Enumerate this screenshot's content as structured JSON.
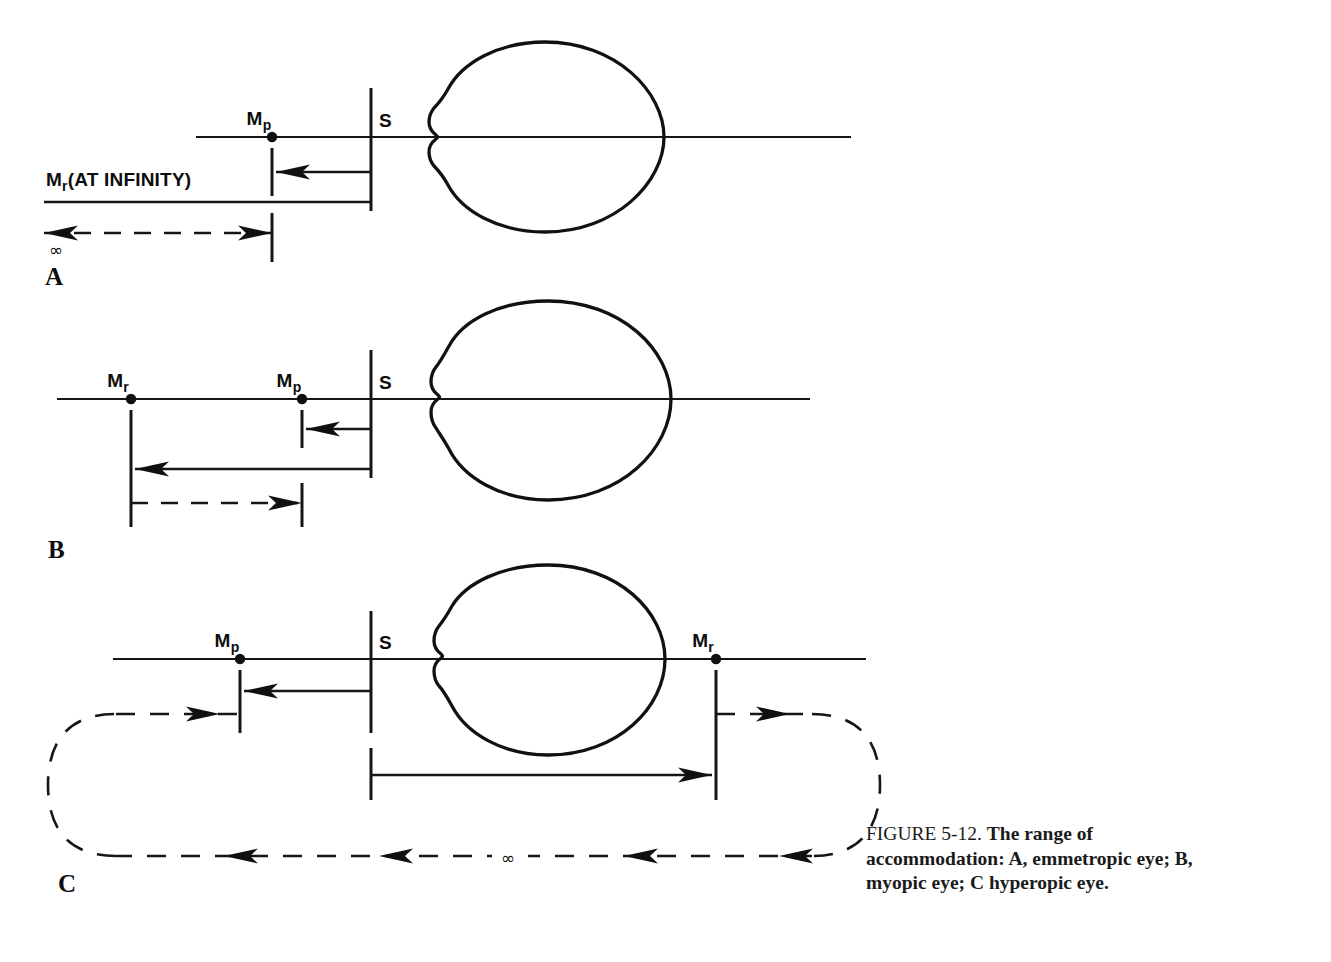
{
  "figure": {
    "caption_number": "FIGURE 5-12.",
    "caption_text": "The range of accommodation: A, emmetropic eye; B, myopic eye; C hyperopic eye.",
    "line_color": "#111111",
    "background": "#ffffff"
  },
  "panels": [
    {
      "letter": "A",
      "name": "emmetropic-eye",
      "labels": {
        "near_point": "M",
        "near_point_sub": "p",
        "far_point_infinity": "M",
        "far_point_infinity_sub": "r",
        "far_point_infinity_rest": "(AT INFINITY)",
        "schematic_eye": "S",
        "infinity_symbol": "∞"
      }
    },
    {
      "letter": "B",
      "name": "myopic-eye",
      "labels": {
        "far_point": "M",
        "far_point_sub": "r",
        "near_point": "M",
        "near_point_sub": "p",
        "schematic_eye": "S"
      }
    },
    {
      "letter": "C",
      "name": "hyperopic-eye",
      "labels": {
        "near_point": "M",
        "near_point_sub": "p",
        "far_point": "M",
        "far_point_sub": "r",
        "schematic_eye": "S",
        "infinity_symbol": "∞"
      }
    }
  ]
}
